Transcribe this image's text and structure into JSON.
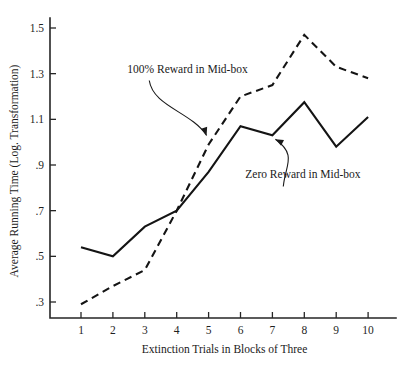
{
  "chart_data": {
    "type": "line",
    "title": "",
    "xlabel": "Extinction Trials in Blocks of Three",
    "ylabel": "Average Running Time (Log. Transformation)",
    "x": [
      1,
      2,
      3,
      4,
      5,
      6,
      7,
      8,
      9,
      10
    ],
    "xticklabels": [
      "1",
      "2",
      "3",
      "4",
      "5",
      "6",
      "7",
      "8",
      "9",
      "10"
    ],
    "yticklabels": [
      ".3",
      ".5",
      ".7",
      ".9",
      "1.1",
      "1.3",
      "1.5"
    ],
    "yticks": [
      0.3,
      0.5,
      0.7,
      0.9,
      1.1,
      1.3,
      1.5
    ],
    "xlim": [
      0.55,
      10.75
    ],
    "ylim": [
      0.235,
      1.56
    ],
    "grid": false,
    "legend": "none",
    "series": [
      {
        "name": "100% Reward in Mid-box",
        "style": "dashed",
        "color": "#141414",
        "values": [
          0.29,
          0.37,
          0.44,
          0.7,
          0.99,
          1.2,
          1.25,
          1.47,
          1.33,
          1.28
        ]
      },
      {
        "name": "Zero Reward in Mid-box",
        "style": "solid",
        "color": "#141414",
        "values": [
          0.54,
          0.5,
          0.63,
          0.7,
          0.87,
          1.07,
          1.03,
          1.175,
          0.98,
          1.11
        ]
      }
    ],
    "annotations": [
      {
        "text": "100% Reward in Mid-box",
        "target_x": 5.0,
        "target_y": 0.99,
        "text_x": 2.45,
        "text_y": 1.305
      },
      {
        "text": "Zero Reward in Mid-box",
        "target_x": 7.0,
        "target_y": 1.03,
        "text_x": 6.15,
        "text_y": 0.845
      }
    ]
  }
}
